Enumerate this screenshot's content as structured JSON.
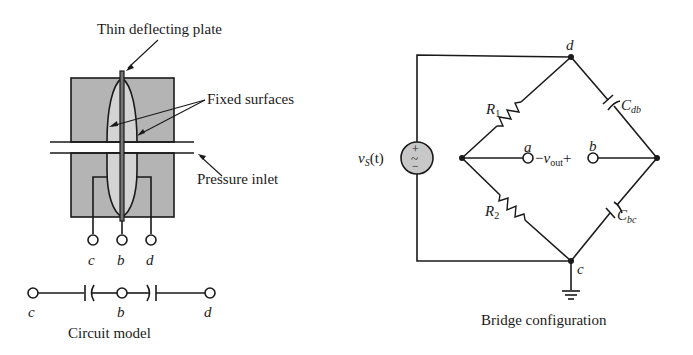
{
  "sensor": {
    "labels": {
      "plate": "Thin deflecting plate",
      "fixed": "Fixed surfaces",
      "inlet": "Pressure inlet"
    },
    "terminals": [
      "c",
      "b",
      "d"
    ],
    "colors": {
      "body_fill": "#b4b4b4",
      "cavity_fill": "#d4d4d4",
      "stroke": "#1a1a1a"
    }
  },
  "circuit_model": {
    "terminals": [
      "c",
      "b",
      "d"
    ],
    "caption": "Circuit model"
  },
  "bridge": {
    "nodes": {
      "top": "d",
      "bottom": "c",
      "left_terminal": "a",
      "right_terminal": "b"
    },
    "source": {
      "name": "v",
      "sub": "S",
      "arg": "(t)",
      "plus": "+",
      "minus": "−",
      "symbol": "~"
    },
    "R1": {
      "name": "R",
      "sub": "1"
    },
    "R2": {
      "name": "R",
      "sub": "2"
    },
    "Cdb": {
      "name": "C",
      "sub": "db"
    },
    "Cbc": {
      "name": "C",
      "sub": "bc"
    },
    "vout": {
      "minus": "−",
      "name": "v",
      "sub": "out",
      "plus": "+"
    },
    "caption": "Bridge configuration"
  }
}
